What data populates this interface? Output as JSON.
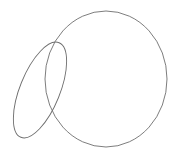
{
  "diagram": {
    "background": "#ffffff",
    "stroke_color": "#6e6e6e",
    "stroke_width": 0.9,
    "shapes": [
      {
        "kind": "ellipse",
        "name": "large-circle",
        "cx": 106,
        "cy": 79,
        "rx": 61,
        "ry": 68,
        "rotate": 0
      },
      {
        "kind": "ellipse",
        "name": "small-ellipse",
        "cx": 40,
        "cy": 90,
        "rx": 20,
        "ry": 51,
        "rotate": 22
      }
    ]
  }
}
